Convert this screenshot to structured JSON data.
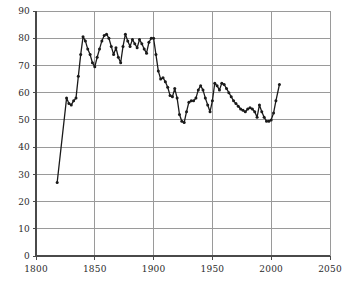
{
  "chart_data": {
    "type": "line",
    "title": "",
    "subtitle": "",
    "xlabel": "",
    "ylabel": "",
    "xlim": [
      1800,
      2050
    ],
    "ylim": [
      0,
      90
    ],
    "grid": true,
    "legend": null,
    "markers": true,
    "line_color": "#1a1a1a",
    "marker_color": "#1a1a1a",
    "grid_color": "#9a9a9a",
    "axis_color": "#4a4a4a",
    "background_color": "#ffffff",
    "xticks": [
      1800,
      1850,
      1900,
      1950,
      2000,
      2050
    ],
    "xtick_labels": [
      "1800",
      "1850",
      "1900",
      "1950",
      "2000",
      "2050"
    ],
    "yticks": [
      0,
      10,
      20,
      30,
      40,
      50,
      60,
      70,
      80,
      90
    ],
    "ytick_labels": [
      "0",
      "10",
      "20",
      "30",
      "40",
      "50",
      "60",
      "70",
      "80",
      "90"
    ],
    "x": [
      1818,
      1826,
      1828,
      1830,
      1832,
      1834,
      1836,
      1838,
      1840,
      1842,
      1844,
      1846,
      1848,
      1850,
      1852,
      1854,
      1856,
      1858,
      1860,
      1862,
      1864,
      1866,
      1868,
      1870,
      1872,
      1874,
      1876,
      1878,
      1880,
      1882,
      1884,
      1886,
      1888,
      1890,
      1892,
      1894,
      1896,
      1898,
      1900,
      1902,
      1904,
      1906,
      1908,
      1910,
      1912,
      1914,
      1916,
      1918,
      1920,
      1922,
      1924,
      1926,
      1928,
      1930,
      1932,
      1934,
      1936,
      1938,
      1940,
      1942,
      1944,
      1946,
      1948,
      1950,
      1952,
      1954,
      1956,
      1958,
      1960,
      1962,
      1964,
      1966,
      1968,
      1970,
      1972,
      1974,
      1976,
      1978,
      1980,
      1982,
      1984,
      1986,
      1988,
      1990,
      1992,
      1994,
      1996,
      1998,
      2000,
      2002,
      2004,
      2007
    ],
    "values": [
      27,
      58,
      56,
      55.5,
      57,
      58,
      66,
      74,
      80.5,
      79,
      76,
      74,
      71,
      69.5,
      73,
      76,
      79,
      81,
      81.5,
      80,
      77,
      74,
      76.5,
      73,
      71,
      77,
      81.5,
      79,
      77,
      79.5,
      78,
      76.5,
      79.5,
      78,
      76,
      74.5,
      78.5,
      80,
      80,
      74,
      68,
      65,
      65.5,
      64,
      62,
      59,
      58.5,
      61.5,
      58,
      52,
      49.5,
      49,
      53,
      56.5,
      57,
      57,
      58,
      61,
      62.5,
      61,
      58,
      55.5,
      53,
      57,
      63.5,
      62.5,
      61,
      63.5,
      63,
      61.5,
      60,
      58.5,
      57,
      56,
      55,
      54,
      53.5,
      53,
      54,
      54.5,
      54,
      53,
      51,
      55.5,
      53,
      51,
      49.5,
      49.5,
      50,
      52.5,
      57,
      63
    ]
  }
}
